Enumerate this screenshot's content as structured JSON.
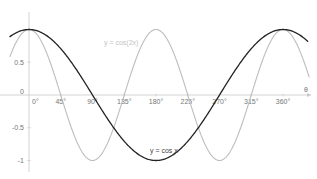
{
  "chart_data": {
    "type": "line",
    "title": "",
    "xlabel": "θ",
    "ylabel": "",
    "x_unit": "degrees",
    "xlim": [
      -27,
      400
    ],
    "ylim": [
      -1.15,
      1.1
    ],
    "grid": false,
    "x_ticks": [
      {
        "value": 0,
        "label": "0°"
      },
      {
        "value": 45,
        "label": "45°"
      },
      {
        "value": 90,
        "label": "90°"
      },
      {
        "value": 135,
        "label": "135°"
      },
      {
        "value": 180,
        "label": "180°"
      },
      {
        "value": 225,
        "label": "225°"
      },
      {
        "value": 270,
        "label": "270°"
      },
      {
        "value": 315,
        "label": "315°"
      },
      {
        "value": 360,
        "label": "360°"
      }
    ],
    "y_ticks": [
      {
        "value": 0.5,
        "label": "0.5"
      },
      {
        "value": 0,
        "label": "0"
      },
      {
        "value": -0.5,
        "label": "-0.5"
      },
      {
        "value": -1,
        "label": "-1"
      }
    ],
    "series": [
      {
        "name": "y = cos x",
        "function": "cos(x)",
        "color": "#222222",
        "stroke_width": 1.3,
        "x_range": [
          -27,
          395
        ],
        "label": "y = cos x",
        "label_position": {
          "x": 150,
          "y": 153
        }
      },
      {
        "name": "y = cos(2x)",
        "function": "cos(2x)",
        "color": "#bdbdbd",
        "stroke_width": 1.1,
        "x_range": [
          -27,
          397
        ],
        "label": "y = cos(2x)",
        "label_position": {
          "x": 104,
          "y": 45
        }
      }
    ],
    "legend": "inline labels on curves"
  },
  "layout": {
    "origin_px": {
      "x": 29,
      "y": 95
    },
    "px_per_degree": 0.7056,
    "px_per_unit_y": 65.5,
    "axis_color": "#c8c8c8",
    "tick_label_color": "#777777"
  }
}
